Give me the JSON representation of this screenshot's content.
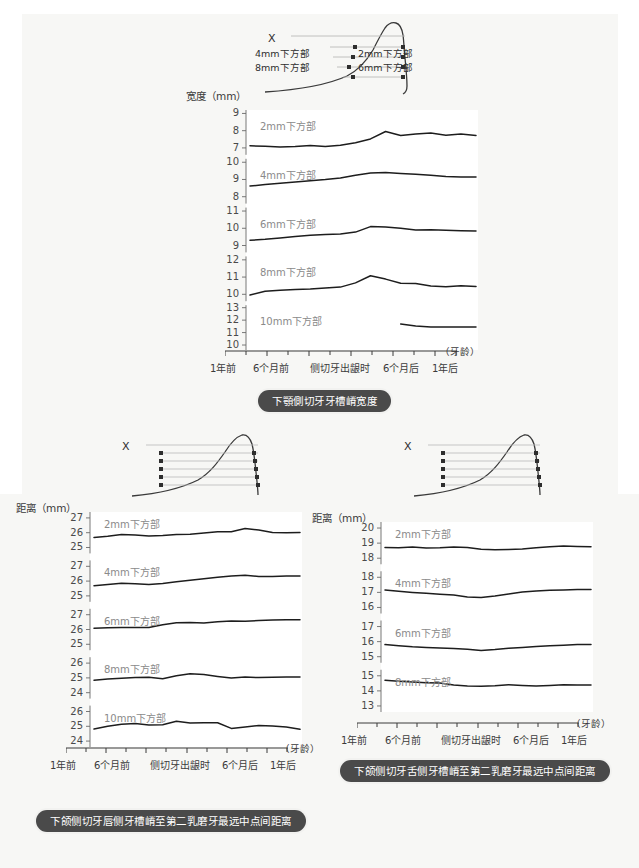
{
  "figure": {
    "background_color": "#f7f7f5",
    "line_color": "#1d1d1d",
    "label_color": "#8a8a8a",
    "caption_bg": "#4a4a4a"
  },
  "chart_data": [
    {
      "id": "top",
      "type": "line",
      "title": "下顎側切牙牙槽嵴宽度",
      "ylabel": "宽度（mm）",
      "xlabel": "（牙龄）",
      "x": [
        "1年前",
        "6个月前",
        "侧切牙出龈时",
        "6个月后",
        "1年后"
      ],
      "tick_count": 12,
      "panels": [
        {
          "name": "2mm下方部",
          "yticks": [
            9,
            8,
            7
          ],
          "ylim": [
            6.6,
            9.2
          ],
          "values": [
            7.12,
            7.1,
            7.05,
            7.08,
            7.14,
            7.08,
            7.16,
            7.3,
            7.52,
            7.95,
            7.72,
            7.8,
            7.86,
            7.74,
            7.8,
            7.72
          ]
        },
        {
          "name": "4mm下方部",
          "yticks": [
            10,
            9,
            8
          ],
          "ylim": [
            7.6,
            10.2
          ],
          "values": [
            8.62,
            8.7,
            8.78,
            8.86,
            8.93,
            8.99,
            9.08,
            9.24,
            9.38,
            9.4,
            9.34,
            9.3,
            9.24,
            9.18,
            9.14,
            9.14
          ]
        },
        {
          "name": "6mm下方部",
          "yticks": [
            11,
            10,
            9
          ],
          "ylim": [
            8.6,
            11.2
          ],
          "values": [
            9.3,
            9.36,
            9.44,
            9.52,
            9.6,
            9.64,
            9.66,
            9.78,
            10.1,
            10.08,
            10.0,
            9.9,
            9.92,
            9.88,
            9.86,
            9.84
          ]
        },
        {
          "name": "8mm下方部",
          "yticks": [
            12,
            11,
            10
          ],
          "ylim": [
            9.6,
            12.2
          ],
          "values": [
            9.96,
            10.18,
            10.24,
            10.28,
            10.3,
            10.36,
            10.42,
            10.66,
            11.08,
            10.88,
            10.64,
            10.62,
            10.48,
            10.44,
            10.5,
            10.46
          ]
        },
        {
          "name": "10mm下方部",
          "yticks": [
            13,
            12,
            11,
            10
          ],
          "ylim": [
            9.6,
            13.2
          ],
          "values": [
            null,
            null,
            null,
            null,
            null,
            null,
            null,
            null,
            null,
            null,
            11.68,
            11.52,
            11.46,
            11.45,
            11.46,
            11.45
          ]
        }
      ],
      "diagram": {
        "x_mark": "X",
        "labels_left": [
          "4mm下方部",
          "8mm下方部"
        ],
        "labels_right": [
          "2mm下方部",
          "6mm下方部"
        ]
      }
    },
    {
      "id": "bottom-left",
      "type": "line",
      "title": "下颌侧切牙唇侧牙槽嵴至第二乳磨牙最远中点间距离",
      "ylabel": "距离（mm）",
      "xlabel": "（牙龄）",
      "x": [
        "1年前",
        "6个月前",
        "侧切牙出龈时",
        "6个月后",
        "1年后"
      ],
      "tick_count": 12,
      "panels": [
        {
          "name": "2mm下方部",
          "yticks": [
            27,
            26,
            25
          ],
          "ylim": [
            24.6,
            27.4
          ],
          "values": [
            25.68,
            25.76,
            25.88,
            25.84,
            25.78,
            25.82,
            25.88,
            25.9,
            25.98,
            26.06,
            26.06,
            26.28,
            26.18,
            26.02,
            26.0,
            26.02
          ]
        },
        {
          "name": "4mm下方部",
          "yticks": [
            27,
            26,
            25
          ],
          "ylim": [
            24.6,
            27.4
          ],
          "values": [
            25.68,
            25.76,
            25.86,
            25.82,
            25.76,
            25.84,
            25.96,
            26.06,
            26.16,
            26.26,
            26.34,
            26.4,
            26.32,
            26.32,
            26.34,
            26.34
          ]
        },
        {
          "name": "6mm下方部",
          "yticks": [
            27,
            26,
            25
          ],
          "ylim": [
            24.6,
            27.4
          ],
          "values": [
            26.08,
            26.12,
            26.14,
            26.14,
            26.14,
            26.32,
            26.46,
            26.48,
            26.44,
            26.52,
            26.58,
            26.56,
            26.6,
            26.64,
            26.66,
            26.66
          ]
        },
        {
          "name": "8mm下方部",
          "yticks": [
            26,
            25,
            24
          ],
          "ylim": [
            23.6,
            26.4
          ],
          "values": [
            24.84,
            24.92,
            24.98,
            25.02,
            25.04,
            24.94,
            25.14,
            25.28,
            25.22,
            25.1,
            25.0,
            25.06,
            25.02,
            25.04,
            25.06,
            25.06
          ]
        },
        {
          "name": "10mm下方部",
          "yticks": [
            26,
            25,
            24
          ],
          "ylim": [
            23.6,
            26.4
          ],
          "values": [
            24.82,
            25.0,
            25.14,
            25.18,
            25.08,
            25.1,
            25.34,
            25.22,
            25.24,
            25.24,
            24.86,
            24.96,
            25.06,
            25.02,
            24.96,
            24.8
          ]
        }
      ],
      "diagram": {
        "x_mark": "X"
      }
    },
    {
      "id": "bottom-right",
      "type": "line",
      "title": "下颌侧切牙舌侧牙槽嵴至第二乳磨牙最远中点间距离",
      "ylabel": "距离（mm）",
      "xlabel": "（牙龄）",
      "x": [
        "1年前",
        "6个月前",
        "侧切牙出龈时",
        "6个月后",
        "1年后"
      ],
      "tick_count": 12,
      "panels": [
        {
          "name": "2mm下方部",
          "yticks": [
            20,
            19,
            18
          ],
          "ylim": [
            17.6,
            20.4
          ],
          "values": [
            18.72,
            18.7,
            18.74,
            18.68,
            18.7,
            18.74,
            18.72,
            18.6,
            18.56,
            18.58,
            18.62,
            18.7,
            18.76,
            18.8,
            18.78,
            18.76
          ]
        },
        {
          "name": "4mm下方部",
          "yticks": [
            18,
            17,
            16
          ],
          "ylim": [
            15.6,
            18.4
          ],
          "values": [
            17.16,
            17.08,
            17.0,
            16.94,
            16.88,
            16.82,
            16.7,
            16.66,
            16.76,
            16.9,
            17.02,
            17.1,
            17.14,
            17.16,
            17.2,
            17.2
          ]
        },
        {
          "name": "6mm下方部",
          "yticks": [
            17,
            16,
            15
          ],
          "ylim": [
            14.6,
            17.4
          ],
          "values": [
            15.8,
            15.72,
            15.66,
            15.62,
            15.58,
            15.54,
            15.5,
            15.42,
            15.48,
            15.56,
            15.62,
            15.68,
            15.72,
            15.76,
            15.8,
            15.8
          ]
        },
        {
          "name": "8mm下方部",
          "yticks": [
            15,
            14,
            13
          ],
          "ylim": [
            12.6,
            15.4
          ],
          "values": [
            14.7,
            14.64,
            14.58,
            14.54,
            14.52,
            14.38,
            14.32,
            14.3,
            14.34,
            14.4,
            14.36,
            14.32,
            14.36,
            14.4,
            14.38,
            14.38
          ]
        }
      ],
      "diagram": {
        "x_mark": "X"
      }
    }
  ]
}
